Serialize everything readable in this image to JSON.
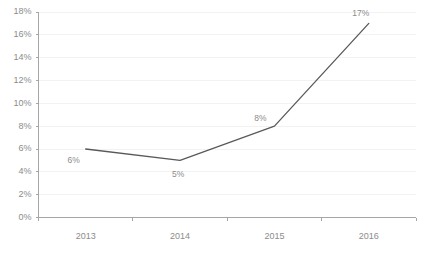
{
  "chart_data": {
    "type": "line",
    "title": "",
    "subtitle": "",
    "xlabel": "",
    "ylabel": "",
    "categories": [
      "2013",
      "2014",
      "2015",
      "2016"
    ],
    "values": [
      6,
      5,
      8,
      17
    ],
    "point_labels": [
      "6%",
      "5%",
      "8%",
      "17%"
    ],
    "series": [
      {
        "name": "",
        "values": [
          6,
          5,
          8,
          17
        ]
      }
    ],
    "ylim": [
      0,
      18
    ],
    "ytick_step": 2,
    "ytick_labels": [
      "0%",
      "2%",
      "4%",
      "6%",
      "8%",
      "10%",
      "12%",
      "14%",
      "16%",
      "18%"
    ],
    "ytick_values": [
      0,
      2,
      4,
      6,
      8,
      10,
      12,
      14,
      16,
      18
    ],
    "grid": "horizontal",
    "legend": "none",
    "line_color": "#595959",
    "grid_color": "#f2f2f2",
    "axis_color": "#a6a6a6",
    "label_color": "#8c8c8c",
    "background_color": "#ffffff",
    "markers": false
  },
  "footer": {
    "fragment_text": ""
  }
}
